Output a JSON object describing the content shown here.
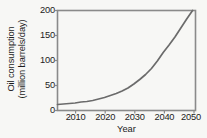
{
  "chart_data": {
    "type": "line",
    "title": "",
    "xlabel": "Year",
    "ylabel": "Oil consumption (million barrels/day)",
    "ylabel_line1": "Oil consumption",
    "ylabel_line2": "(million barrels/day)",
    "xlim": [
      2004,
      2051
    ],
    "ylim": [
      0,
      200
    ],
    "xticks": [
      2010,
      2020,
      2030,
      2040,
      2050
    ],
    "yticks": [
      0,
      50,
      100,
      150,
      200
    ],
    "xtick_labels": [
      "2010",
      "2020",
      "2030",
      "2040",
      "2050"
    ],
    "ytick_labels": [
      "0",
      "50",
      "100",
      "150",
      "200"
    ],
    "grid": false,
    "legend": "none",
    "series": [
      {
        "name": "Oil consumption",
        "color": "#6b6b6b",
        "x": [
          2004,
          2006,
          2008,
          2010,
          2012,
          2014,
          2016,
          2018,
          2020,
          2022,
          2024,
          2026,
          2028,
          2030,
          2032,
          2034,
          2036,
          2038,
          2040,
          2042,
          2044,
          2046,
          2048,
          2050
        ],
        "values": [
          12,
          13,
          14,
          15,
          17,
          18,
          20,
          23,
          26,
          30,
          34,
          39,
          45,
          53,
          62,
          72,
          84,
          99,
          116,
          131,
          147,
          165,
          183,
          200
        ]
      }
    ]
  },
  "axes": {
    "frame_color": "#8a8a8a",
    "text_color": "#1c1c1c",
    "background": "#f7f7f5"
  }
}
